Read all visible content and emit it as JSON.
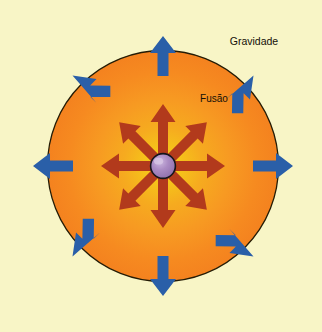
{
  "diagram": {
    "background_color": "#f8f5c6",
    "labels": {
      "gravity": "Gravidade",
      "fusion": "Fusão"
    },
    "star": {
      "name": "star-body",
      "center_x": 163,
      "center_y": 166,
      "radius": 115,
      "outline_color": "#2a2008",
      "core_glow_color": "#f5c21a",
      "mid_color": "#f79a22",
      "edge_color": "#f4821f"
    },
    "core": {
      "name": "stellar-core",
      "center_x": 163,
      "center_y": 166,
      "radius": 12,
      "fill_color": "#a283bd",
      "highlight_color": "#c9b4dc",
      "outline_color": "#1a1a1a"
    },
    "gravity_arrows": {
      "name": "gravity-arrow-group",
      "color": "#2a5fa8",
      "count": 8,
      "direction": "inward",
      "angles_deg": [
        0,
        45,
        90,
        135,
        180,
        225,
        270,
        315
      ]
    },
    "fusion_arrows": {
      "name": "fusion-arrow-group",
      "color": "#b23a1c",
      "count": 8,
      "direction": "outward",
      "angles_deg": [
        0,
        45,
        90,
        135,
        180,
        225,
        270,
        315
      ]
    }
  }
}
